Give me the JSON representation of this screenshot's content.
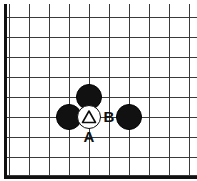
{
  "diagram": {
    "kind": "go-board-diagram",
    "board": {
      "width_px": 197,
      "height_px": 181,
      "grid_spacing_px": 20,
      "origin_x_px": 9,
      "origin_y_px": 17,
      "columns": 10,
      "rows": 9,
      "line_color": "#3a3a3a",
      "edge_color": "#111111",
      "background_color": "#ffffff",
      "edges_visible": [
        "left",
        "bottom"
      ]
    },
    "stones": [
      {
        "id": "stone-black-top",
        "color": "black",
        "col": 4,
        "row": 4,
        "x_px": 89,
        "y_px": 97,
        "radius_px": 13
      },
      {
        "id": "stone-black-left",
        "color": "black",
        "col": 3,
        "row": 5,
        "x_px": 69,
        "y_px": 117,
        "radius_px": 13
      },
      {
        "id": "stone-white-marked",
        "color": "white",
        "col": 4,
        "row": 5,
        "x_px": 89,
        "y_px": 117,
        "radius_px": 12,
        "marker": "triangle"
      },
      {
        "id": "stone-black-right",
        "color": "black",
        "col": 6,
        "row": 5,
        "x_px": 129,
        "y_px": 117,
        "radius_px": 13
      }
    ],
    "labels": [
      {
        "id": "label-a",
        "text": "A",
        "x_px": 89,
        "y_px": 136,
        "font_size_px": 15,
        "color": "#111111"
      },
      {
        "id": "label-b",
        "text": "B",
        "x_px": 109,
        "y_px": 116,
        "font_size_px": 15,
        "color": "#111111"
      }
    ],
    "marker_colors": {
      "triangle_stroke": "#0d0d0d"
    }
  }
}
